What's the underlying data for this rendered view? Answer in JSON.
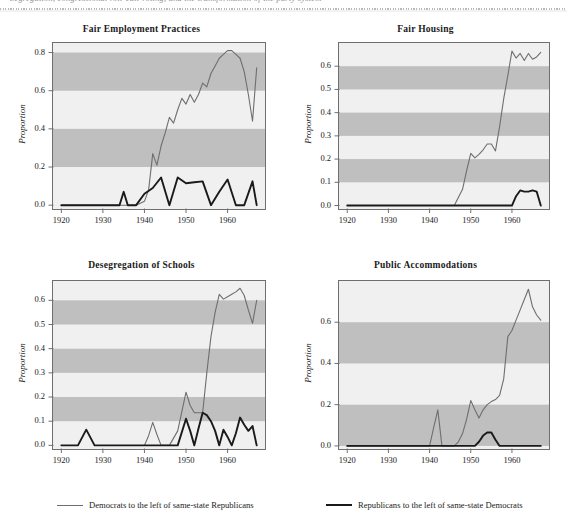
{
  "header": {
    "running_text": "Segregation, congressional roll-call voting, and the transformation of the party system",
    "visible": true
  },
  "legend": {
    "items": [
      {
        "label": "Democrats to the left of same-state Republicans",
        "color": "#6e6e6e",
        "width": 1.2
      },
      {
        "label": "Republicans to the left of same-state Democrats",
        "color": "#1a1a1a",
        "width": 2.0
      }
    ]
  },
  "colors": {
    "band_light": "#f0f0f0",
    "band_dark": "#bfbfbf",
    "frame": "#6f6f6f",
    "dem_line": "#6e6e6e",
    "rep_line": "#1a1a1a",
    "text": "#1a1a1a"
  },
  "chart_data": [
    {
      "type": "line",
      "title": "Fair Employment Practices",
      "xlabel": "",
      "ylabel": "Proportion",
      "xlim": [
        1918,
        1969
      ],
      "ylim": [
        -0.02,
        0.85
      ],
      "xticks": [
        1920,
        1930,
        1940,
        1950,
        1960
      ],
      "xticklabels": [
        "1920",
        "1930",
        "1940",
        "1950",
        "1960"
      ],
      "yticks": [
        0.0,
        0.2,
        0.4,
        0.6,
        0.8
      ],
      "yticklabels": [
        "0.0",
        "0.2",
        "0.4",
        "0.6",
        "0.8"
      ],
      "grid": false,
      "bands": [
        [
          0.2,
          0.4
        ],
        [
          0.6,
          0.8
        ]
      ],
      "legend_position": "below-figure",
      "series": [
        {
          "name": "Democrats to the left of same-state Republicans",
          "color": "#6e6e6e",
          "x": [
            1920,
            1922,
            1924,
            1926,
            1928,
            1930,
            1932,
            1934,
            1936,
            1938,
            1940,
            1941,
            1942,
            1943,
            1944,
            1945,
            1946,
            1947,
            1948,
            1949,
            1950,
            1951,
            1952,
            1953,
            1954,
            1955,
            1956,
            1957,
            1958,
            1959,
            1960,
            1961,
            1962,
            1963,
            1964,
            1965,
            1966,
            1967
          ],
          "y": [
            0.0,
            0.0,
            0.0,
            0.0,
            0.0,
            0.0,
            0.0,
            0.0,
            0.0,
            0.0,
            0.02,
            0.08,
            0.27,
            0.21,
            0.31,
            0.38,
            0.46,
            0.43,
            0.5,
            0.56,
            0.53,
            0.58,
            0.54,
            0.58,
            0.64,
            0.62,
            0.69,
            0.73,
            0.77,
            0.79,
            0.81,
            0.81,
            0.79,
            0.77,
            0.7,
            0.58,
            0.44,
            0.72
          ]
        },
        {
          "name": "Republicans to the left of same-state Democrats",
          "color": "#1a1a1a",
          "x": [
            1920,
            1922,
            1924,
            1926,
            1928,
            1930,
            1932,
            1934,
            1935,
            1936,
            1937,
            1938,
            1940,
            1942,
            1944,
            1946,
            1948,
            1950,
            1952,
            1954,
            1956,
            1958,
            1960,
            1962,
            1964,
            1966,
            1967
          ],
          "y": [
            0.0,
            0.0,
            0.0,
            0.0,
            0.0,
            0.0,
            0.0,
            0.0,
            0.07,
            0.0,
            0.0,
            0.0,
            0.06,
            0.09,
            0.145,
            0.0,
            0.145,
            0.115,
            0.12,
            0.125,
            0.0,
            0.07,
            0.135,
            0.0,
            0.0,
            0.125,
            0.0
          ]
        }
      ]
    },
    {
      "type": "line",
      "title": "Fair Housing",
      "xlabel": "",
      "ylabel": "Proportion",
      "xlim": [
        1918,
        1969
      ],
      "ylim": [
        -0.015,
        0.7
      ],
      "xticks": [
        1920,
        1930,
        1940,
        1950,
        1960
      ],
      "xticklabels": [
        "1920",
        "1930",
        "1940",
        "1950",
        "1960"
      ],
      "yticks": [
        0.0,
        0.1,
        0.2,
        0.3,
        0.4,
        0.5,
        0.6
      ],
      "yticklabels": [
        "0.0",
        "0.1",
        "0.2",
        "0.3",
        "0.4",
        "0.5",
        "0.6"
      ],
      "grid": false,
      "bands": [
        [
          0.1,
          0.2
        ],
        [
          0.3,
          0.4
        ],
        [
          0.5,
          0.6
        ]
      ],
      "legend_position": "below-figure",
      "series": [
        {
          "name": "Democrats to the left of same-state Republicans",
          "color": "#6e6e6e",
          "x": [
            1946,
            1948,
            1949,
            1950,
            1951,
            1952,
            1953,
            1954,
            1955,
            1956,
            1957,
            1958,
            1959,
            1960,
            1961,
            1962,
            1963,
            1964,
            1965,
            1966,
            1967
          ],
          "y": [
            0.0,
            0.07,
            0.15,
            0.225,
            0.205,
            0.22,
            0.24,
            0.265,
            0.265,
            0.235,
            0.34,
            0.46,
            0.56,
            0.665,
            0.635,
            0.655,
            0.625,
            0.655,
            0.63,
            0.64,
            0.66
          ]
        },
        {
          "name": "Republicans to the left of same-state Democrats",
          "color": "#1a1a1a",
          "x": [
            1920,
            1930,
            1940,
            1950,
            1955,
            1959,
            1960,
            1961,
            1962,
            1963,
            1964,
            1965,
            1966,
            1967
          ],
          "y": [
            0.0,
            0.0,
            0.0,
            0.0,
            0.0,
            0.0,
            0.0,
            0.04,
            0.065,
            0.06,
            0.06,
            0.065,
            0.06,
            0.0
          ]
        }
      ]
    },
    {
      "type": "line",
      "title": "Desegregation of Schools",
      "xlabel": "",
      "ylabel": "Proportion",
      "xlim": [
        1918,
        1969
      ],
      "ylim": [
        -0.015,
        0.68
      ],
      "xticks": [
        1920,
        1930,
        1940,
        1950,
        1960
      ],
      "xticklabels": [
        "1920",
        "1930",
        "1940",
        "1950",
        "1960"
      ],
      "yticks": [
        0.0,
        0.1,
        0.2,
        0.3,
        0.4,
        0.5,
        0.6
      ],
      "yticklabels": [
        "0.0",
        "0.1",
        "0.2",
        "0.3",
        "0.4",
        "0.5",
        "0.6"
      ],
      "grid": false,
      "bands": [
        [
          0.1,
          0.2
        ],
        [
          0.3,
          0.4
        ],
        [
          0.5,
          0.6
        ]
      ],
      "legend_position": "below-figure",
      "series": [
        {
          "name": "Democrats to the left of same-state Republicans",
          "color": "#6e6e6e",
          "x": [
            1940,
            1941,
            1942,
            1943,
            1944,
            1946,
            1948,
            1950,
            1951,
            1952,
            1953,
            1954,
            1955,
            1956,
            1957,
            1958,
            1959,
            1960,
            1961,
            1962,
            1963,
            1964,
            1965,
            1966,
            1967
          ],
          "y": [
            0.0,
            0.04,
            0.095,
            0.045,
            0.0,
            0.0,
            0.06,
            0.22,
            0.165,
            0.135,
            0.135,
            0.135,
            0.3,
            0.45,
            0.55,
            0.625,
            0.605,
            0.615,
            0.625,
            0.635,
            0.65,
            0.62,
            0.56,
            0.505,
            0.6
          ]
        },
        {
          "name": "Republicans to the left of same-state Democrats",
          "color": "#1a1a1a",
          "x": [
            1920,
            1924,
            1926,
            1928,
            1930,
            1940,
            1946,
            1948,
            1950,
            1951,
            1952,
            1953,
            1954,
            1955,
            1956,
            1957,
            1958,
            1959,
            1960,
            1961,
            1962,
            1963,
            1964,
            1965,
            1966,
            1967
          ],
          "y": [
            0.0,
            0.0,
            0.065,
            0.0,
            0.0,
            0.0,
            0.0,
            0.0,
            0.11,
            0.06,
            0.0,
            0.07,
            0.135,
            0.125,
            0.1,
            0.06,
            0.0,
            0.065,
            0.035,
            0.0,
            0.05,
            0.115,
            0.085,
            0.06,
            0.08,
            0.0
          ]
        }
      ]
    },
    {
      "type": "line",
      "title": "Public Accommodations",
      "xlabel": "",
      "ylabel": "Proportion",
      "xlim": [
        1918,
        1969
      ],
      "ylim": [
        -0.015,
        0.8
      ],
      "xticks": [
        1920,
        1930,
        1940,
        1950,
        1960
      ],
      "xticklabels": [
        "1920",
        "1930",
        "1940",
        "1950",
        "1960"
      ],
      "yticks": [
        0.0,
        0.2,
        0.4,
        0.6
      ],
      "yticklabels": [
        "0.0",
        "0.2",
        "0.4",
        "0.6"
      ],
      "grid": false,
      "bands": [
        [
          0.0,
          0.2
        ],
        [
          0.4,
          0.6
        ]
      ],
      "legend_position": "below-figure",
      "series": [
        {
          "name": "Democrats to the left of same-state Republicans",
          "color": "#6e6e6e",
          "x": [
            1920,
            1930,
            1940,
            1941,
            1942,
            1943,
            1946,
            1947,
            1948,
            1949,
            1950,
            1951,
            1952,
            1953,
            1954,
            1955,
            1956,
            1957,
            1958,
            1959,
            1960,
            1961,
            1962,
            1963,
            1964,
            1965,
            1966,
            1967
          ],
          "y": [
            0.0,
            0.0,
            0.0,
            0.09,
            0.175,
            0.0,
            0.0,
            0.02,
            0.06,
            0.13,
            0.22,
            0.175,
            0.135,
            0.175,
            0.2,
            0.215,
            0.225,
            0.245,
            0.325,
            0.53,
            0.56,
            0.61,
            0.66,
            0.71,
            0.76,
            0.675,
            0.635,
            0.61
          ]
        },
        {
          "name": "Republicans to the left of same-state Democrats",
          "color": "#1a1a1a",
          "x": [
            1920,
            1930,
            1940,
            1946,
            1950,
            1951,
            1952,
            1953,
            1954,
            1955,
            1956,
            1957,
            1958,
            1960,
            1962,
            1964,
            1966,
            1967
          ],
          "y": [
            0.0,
            0.0,
            0.0,
            0.0,
            0.0,
            0.0,
            0.02,
            0.05,
            0.065,
            0.065,
            0.03,
            0.0,
            0.0,
            0.0,
            0.0,
            0.0,
            0.0,
            0.0
          ]
        }
      ]
    }
  ]
}
